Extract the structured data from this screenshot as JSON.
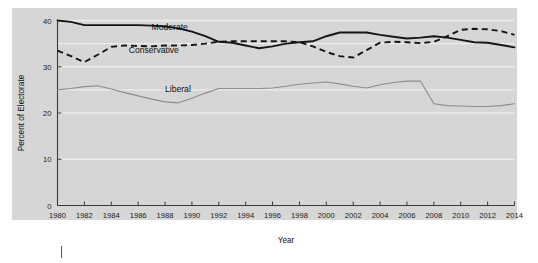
{
  "chart_data": {
    "type": "line",
    "title": "",
    "xlabel": "Year",
    "ylabel": "Percent of Electorate",
    "xlim": [
      1980,
      2014
    ],
    "ylim": [
      0,
      40
    ],
    "grid": true,
    "legend_position": "inline-labels",
    "x": [
      1980,
      1981,
      1982,
      1983,
      1984,
      1985,
      1986,
      1987,
      1988,
      1989,
      1990,
      1991,
      1992,
      1993,
      1994,
      1995,
      1996,
      1997,
      1998,
      1999,
      2000,
      2001,
      2002,
      2003,
      2004,
      2005,
      2006,
      2007,
      2008,
      2009,
      2010,
      2011,
      2012,
      2013,
      2014
    ],
    "xticks": [
      1980,
      1982,
      1984,
      1986,
      1988,
      1990,
      1992,
      1994,
      1996,
      1998,
      2000,
      2002,
      2004,
      2006,
      2008,
      2010,
      2012,
      2014
    ],
    "xtick_labels": [
      "1980",
      "1982",
      "1984",
      "1986",
      "1988",
      "1990",
      "1992",
      "1994",
      "1996",
      "1998",
      "2000",
      "2002",
      "2004",
      "2006",
      "2008",
      "2010",
      "2012",
      "2014"
    ],
    "yticks": [
      0,
      10,
      20,
      30,
      40
    ],
    "ytick_labels": [
      "0",
      "10",
      "20",
      "30",
      "40"
    ],
    "series": [
      {
        "name": "Moderate",
        "style": "solid",
        "color": "#161616",
        "label_position": {
          "x": 1987.0,
          "y": 38.6
        },
        "values": [
          40.0,
          39.7,
          39.0,
          39.0,
          39.0,
          39.0,
          39.0,
          38.9,
          38.7,
          38.3,
          37.6,
          36.6,
          35.4,
          35.2,
          34.6,
          34.0,
          34.4,
          35.0,
          35.3,
          35.5,
          36.6,
          37.4,
          37.4,
          37.4,
          36.9,
          36.5,
          36.1,
          36.3,
          36.6,
          36.3,
          35.8,
          35.3,
          35.2,
          34.7,
          34.2
        ]
      },
      {
        "name": "Conservative",
        "style": "dashed",
        "color": "#161616",
        "label_position": {
          "x": 1985.3,
          "y": 33.6
        },
        "values": [
          33.5,
          32.3,
          31.0,
          32.6,
          34.3,
          34.6,
          34.5,
          34.4,
          34.6,
          34.6,
          34.7,
          35.0,
          35.4,
          35.5,
          35.5,
          35.5,
          35.5,
          35.5,
          35.3,
          34.4,
          33.2,
          32.3,
          32.0,
          33.6,
          35.2,
          35.4,
          35.3,
          35.1,
          35.4,
          36.6,
          38.0,
          38.2,
          38.1,
          37.7,
          36.9
        ]
      },
      {
        "name": "Liberal",
        "style": "solid-thin",
        "color": "#8d8d8d",
        "label_position": {
          "x": 1988.0,
          "y": 25.2
        },
        "values": [
          25.0,
          25.3,
          25.7,
          25.9,
          25.2,
          24.4,
          23.7,
          23.0,
          22.4,
          22.2,
          23.2,
          24.3,
          25.3,
          25.3,
          25.3,
          25.3,
          25.4,
          25.8,
          26.2,
          26.5,
          26.7,
          26.3,
          25.8,
          25.4,
          26.1,
          26.6,
          26.9,
          26.9,
          22.0,
          21.6,
          21.5,
          21.4,
          21.4,
          21.6,
          22.0
        ]
      }
    ]
  }
}
